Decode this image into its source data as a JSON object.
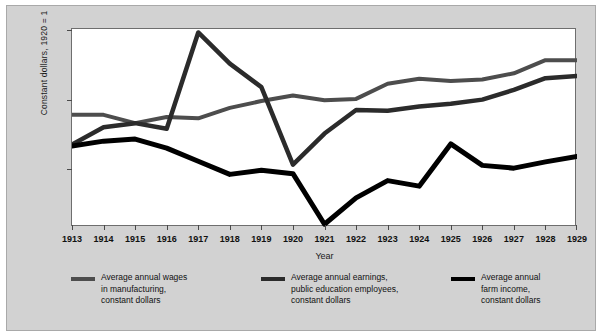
{
  "figure": {
    "background_color": "#d2d2d2",
    "plot_background_color": "#ffffff"
  },
  "axes": {
    "y_title": "Constant dollars, 1920 = 1",
    "x_title": "Year",
    "y_ticks": [
      "2000",
      "1500",
      "1000"
    ],
    "x_ticks": [
      "1913",
      "1914",
      "1915",
      "1916",
      "1917",
      "1918",
      "1919",
      "1920",
      "1921",
      "1922",
      "1923",
      "1924",
      "1925",
      "1926",
      "1927",
      "1928",
      "1929"
    ]
  },
  "legend": {
    "items": [
      {
        "name": "legend-wages",
        "color": "#4d4d4d",
        "lines": [
          "Average annual wages",
          "in manufacturing,",
          "constant dollars"
        ]
      },
      {
        "name": "legend-education",
        "color": "#2b2b2b",
        "lines": [
          "Average annual earnings,",
          "public education employees,",
          "constant dollars"
        ]
      },
      {
        "name": "legend-farm",
        "color": "#000000",
        "lines": [
          "Average annual",
          "farm income,",
          "constant dollars"
        ]
      }
    ]
  },
  "chart_data": {
    "type": "line",
    "title": "",
    "xlabel": "Year",
    "ylabel": "Constant dollars, 1920 = 1",
    "x": [
      1913,
      1914,
      1915,
      1916,
      1917,
      1918,
      1919,
      1920,
      1921,
      1922,
      1923,
      1924,
      1925,
      1926,
      1927,
      1928,
      1929
    ],
    "xlim": [
      1913,
      1929
    ],
    "ylim": [
      580,
      2010
    ],
    "yticks": [
      1000,
      1500,
      2000
    ],
    "grid": false,
    "legend_position": "below",
    "series": [
      {
        "name": "Average annual wages in manufacturing, constant dollars",
        "color": "#4d4d4d",
        "values": [
          1390,
          1390,
          1330,
          1375,
          1365,
          1440,
          1490,
          1530,
          1495,
          1505,
          1615,
          1650,
          1635,
          1645,
          1690,
          1785,
          1785
        ]
      },
      {
        "name": "Average annual earnings, public education employees, constant dollars",
        "color": "#2b2b2b",
        "values": [
          1175,
          1300,
          1330,
          1290,
          1985,
          1760,
          1590,
          1030,
          1255,
          1425,
          1420,
          1450,
          1470,
          1500,
          1570,
          1655,
          1670
        ]
      },
      {
        "name": "Average annual farm income, constant dollars",
        "color": "#000000",
        "values": [
          1165,
          1200,
          1215,
          1150,
          1055,
          960,
          990,
          965,
          600,
          790,
          915,
          875,
          1180,
          1025,
          1005,
          1050,
          1090
        ]
      }
    ]
  }
}
